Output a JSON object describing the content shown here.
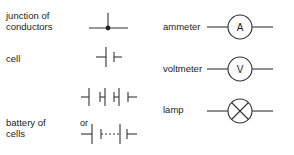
{
  "symbols": {
    "junction": {
      "label_line1": "junction of",
      "label_line2": "conductors"
    },
    "cell": {
      "label": "cell"
    },
    "battery": {
      "label_line1": "battery of",
      "label_line2": "cells",
      "or_label": "or"
    },
    "ammeter": {
      "label": "ammeter",
      "glyph": "A"
    },
    "voltmeter": {
      "label": "voltmeter",
      "glyph": "V"
    },
    "lamp": {
      "label": "lamp"
    }
  },
  "colors": {
    "stroke": "#333333",
    "text": "#222222",
    "background": "#ffffff"
  }
}
